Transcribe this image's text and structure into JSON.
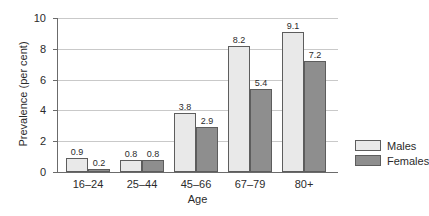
{
  "chart_data": {
    "type": "bar",
    "title": "",
    "xlabel": "Age",
    "ylabel": "Prevalence (per cent)",
    "categories": [
      "16–24",
      "25–44",
      "45–66",
      "67–79",
      "80+"
    ],
    "series": [
      {
        "name": "Males",
        "color": "#e9e9e9",
        "values": [
          0.9,
          0.8,
          3.8,
          8.2,
          9.1
        ]
      },
      {
        "name": "Females",
        "color": "#8e8e8e",
        "values": [
          0.2,
          0.8,
          2.9,
          5.4,
          7.2
        ]
      }
    ],
    "ylim": [
      0,
      10
    ],
    "yticks": [
      0,
      2,
      4,
      6,
      8,
      10
    ],
    "ytick_labels": [
      "0",
      "2",
      "4",
      "6",
      "8",
      "10"
    ],
    "grid": true,
    "data_labels": true,
    "legend_position": "right"
  },
  "legend": {
    "items": [
      {
        "label": "Males"
      },
      {
        "label": "Females"
      }
    ]
  }
}
